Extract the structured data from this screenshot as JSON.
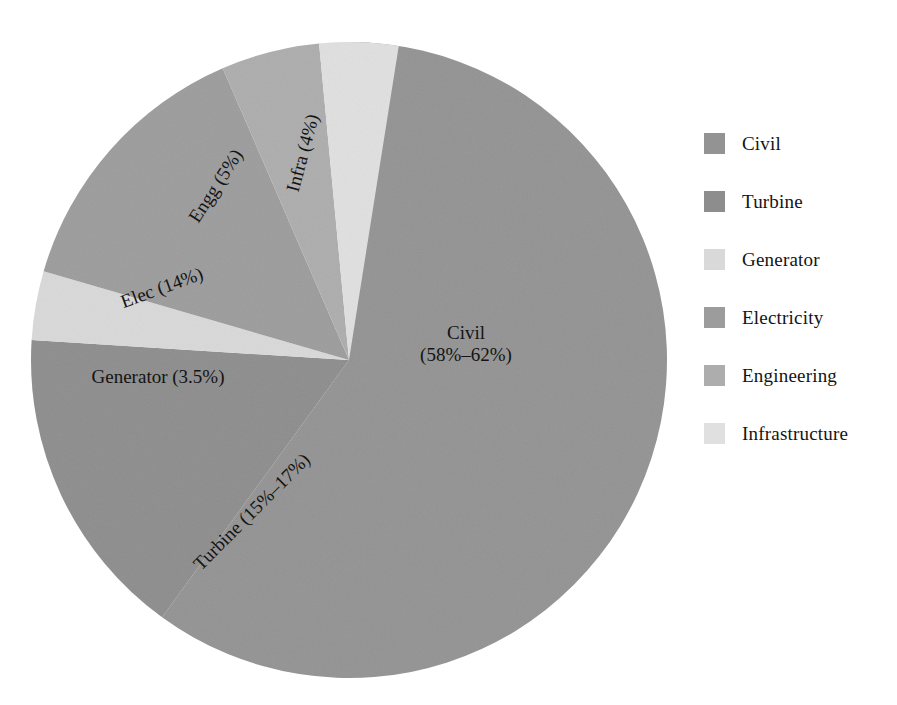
{
  "chart_data": {
    "type": "pie",
    "title": "",
    "subtitle": "",
    "xlabel": "",
    "ylabel": "",
    "grid": false,
    "legend_position": "right",
    "start_angle_deg": 0,
    "direction": "clockwise",
    "center": {
      "x": 349,
      "y": 360
    },
    "radius": 318,
    "categories": [
      "Civil",
      "Turbine",
      "Generator",
      "Electricity",
      "Engineering",
      "Infrastructure"
    ],
    "values": [
      60,
      16,
      3.5,
      14,
      5,
      4
    ],
    "slices": [
      {
        "name": "Civil",
        "legend_label": "Civil",
        "wedge_label": "Civil\n(58%–62%)",
        "value": 60,
        "range_low": 58,
        "range_high": 62,
        "percent_text": "(58%–62%)",
        "color": "#939393",
        "start_deg": 0,
        "end_deg": 216,
        "label_rotation_deg": 0,
        "label_x": 466,
        "label_y": 344
      },
      {
        "name": "Turbine",
        "legend_label": "Turbine",
        "wedge_label": "Turbine (15%–17%)",
        "value": 16,
        "range_low": 15,
        "range_high": 17,
        "percent_text": "(15%–17%)",
        "color": "#8d8d8d",
        "start_deg": 216,
        "end_deg": 273.6,
        "label_rotation_deg": -45,
        "label_x": 252,
        "label_y": 512
      },
      {
        "name": "Generator",
        "legend_label": "Generator",
        "wedge_label": "Generator (3.5%)",
        "value": 3.5,
        "percent_text": "(3.5%)",
        "color": "#d9d9d9",
        "start_deg": 273.6,
        "end_deg": 286.2,
        "label_rotation_deg": 0,
        "label_x": 158,
        "label_y": 377
      },
      {
        "name": "Electricity",
        "legend_label": "Electricity",
        "wedge_label": "Elec (14%)",
        "value": 14,
        "percent_text": "(14%)",
        "color": "#9c9c9c",
        "start_deg": 286.2,
        "end_deg": 336.6,
        "label_rotation_deg": -20,
        "label_x": 162,
        "label_y": 288
      },
      {
        "name": "Engineering",
        "legend_label": "Engineering",
        "wedge_label": "Engg (5%)",
        "value": 5,
        "percent_text": "(5%)",
        "color": "#adadad",
        "start_deg": 336.6,
        "end_deg": 354.6,
        "label_rotation_deg": -57,
        "label_x": 216,
        "label_y": 186
      },
      {
        "name": "Infrastructure",
        "legend_label": "Infrastructure",
        "wedge_label": "Infra (4%)",
        "value": 4,
        "percent_text": "(4%)",
        "color": "#e0e0e0",
        "start_deg": 354.6,
        "end_deg": 369.0,
        "label_rotation_deg": -75,
        "label_x": 303,
        "label_y": 153
      }
    ]
  },
  "legend": {
    "entries": [
      {
        "label": "Civil",
        "color": "#939393"
      },
      {
        "label": "Turbine",
        "color": "#8d8d8d"
      },
      {
        "label": "Generator",
        "color": "#d9d9d9"
      },
      {
        "label": "Electricity",
        "color": "#9c9c9c"
      },
      {
        "label": "Engineering",
        "color": "#adadad"
      },
      {
        "label": "Infrastructure",
        "color": "#e0e0e0"
      }
    ]
  },
  "colors": {
    "background": "#ffffff",
    "text": "#141414",
    "civil": "#939393",
    "turbine": "#8d8d8d",
    "generator": "#d9d9d9",
    "electricity": "#9c9c9c",
    "engineering": "#adadad",
    "infrastructure": "#e0e0e0"
  }
}
